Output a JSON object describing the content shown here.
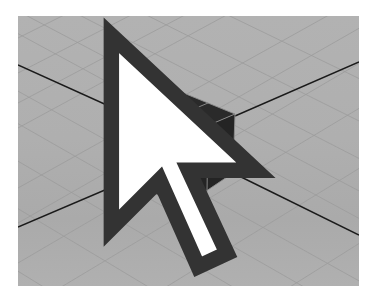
{
  "app": {
    "view": "3D perspective viewport",
    "scene": {
      "object": "polygon cube",
      "subdivisions": {
        "width": 2,
        "height": 2,
        "depth": 2
      },
      "display": "shaded with wireframe"
    },
    "ground_grid": {
      "visible": true,
      "origin_axes_visible": true
    },
    "cursor": {
      "type": "arrow-pointer"
    }
  },
  "colors": {
    "viewport_background": "#b0b0b0",
    "grid": "#9c9c9c",
    "axis": "#1a1a1a",
    "cube_fill": "#222222",
    "cube_wire": "#8f8f8f",
    "cursor": "#ffffff"
  }
}
